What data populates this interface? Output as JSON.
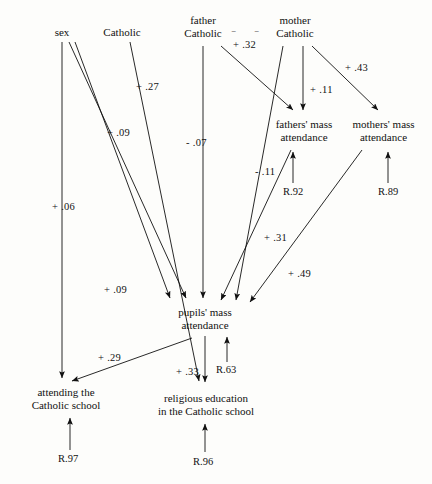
{
  "diagram": {
    "nodes": [
      {
        "id": "sex",
        "label": "sex",
        "x": 62,
        "y": 33,
        "lines": [
          "sex"
        ]
      },
      {
        "id": "catholic",
        "label": "Catholic",
        "x": 122,
        "y": 33,
        "lines": [
          "Catholic"
        ]
      },
      {
        "id": "father_catholic",
        "label": "father Catholic",
        "x": 203,
        "y": 27,
        "lines": [
          "father",
          "Catholic"
        ]
      },
      {
        "id": "mother_catholic",
        "label": "mother Catholic",
        "x": 295,
        "y": 27,
        "lines": [
          "mother",
          "Catholic"
        ]
      },
      {
        "id": "fathers_mass",
        "label": "fathers' mass attendance",
        "x": 303,
        "y": 130,
        "lines": [
          "fathers' mass",
          "attendance"
        ]
      },
      {
        "id": "mothers_mass",
        "label": "mothers' mass attendance",
        "x": 382,
        "y": 130,
        "lines": [
          "mothers' mass",
          "attendance"
        ]
      },
      {
        "id": "pupils_mass",
        "label": "pupils' mass attendance",
        "x": 205,
        "y": 317,
        "lines": [
          "pupils' mass",
          "attendance"
        ]
      },
      {
        "id": "attending",
        "label": "attending the Catholic school",
        "x": 62,
        "y": 395,
        "lines": [
          "attending the",
          "Catholic school"
        ]
      },
      {
        "id": "religious_ed",
        "label": "religious education in the Catholic school",
        "x": 208,
        "y": 400,
        "lines": [
          "religious education",
          "in the Catholic school"
        ]
      }
    ],
    "coefficients": [
      {
        "id": "c_mother_fathersmass",
        "value": "+ .32",
        "x": 233,
        "y": 39
      },
      {
        "id": "c_catholic_pupils",
        "value": "+ .27",
        "x": 136,
        "y": 81
      },
      {
        "id": "c_mother_fmass2",
        "value": "+ .11",
        "x": 310,
        "y": 84
      },
      {
        "id": "c_mother_mmass",
        "value": "+ .43",
        "x": 345,
        "y": 62
      },
      {
        "id": "c_sex_pupils1",
        "value": "+ .09",
        "x": 107,
        "y": 127
      },
      {
        "id": "c_father_pupils",
        "value": "- .07",
        "x": 186,
        "y": 137
      },
      {
        "id": "c_fathercat_pupils",
        "value": "- .11",
        "x": 255,
        "y": 166
      },
      {
        "id": "c_sex_attending",
        "value": "+ .06",
        "x": 52,
        "y": 201
      },
      {
        "id": "c_fmass_pupils",
        "value": "+ .31",
        "x": 264,
        "y": 232
      },
      {
        "id": "c_sex_pupils2",
        "value": "+ .09",
        "x": 104,
        "y": 284
      },
      {
        "id": "c_mmass_pupils",
        "value": "+ .49",
        "x": 288,
        "y": 268
      },
      {
        "id": "c_pupils_attending",
        "value": "+ .29",
        "x": 98,
        "y": 352
      },
      {
        "id": "c_pupils_religed",
        "value": "+ .33",
        "x": 176,
        "y": 366
      }
    ],
    "residuals": [
      {
        "id": "r_fathers_mass",
        "value": "R.92",
        "x": 283,
        "y": 191
      },
      {
        "id": "r_mothers_mass",
        "value": "R.89",
        "x": 378,
        "y": 191
      },
      {
        "id": "r_pupils_mass",
        "value": "R.63",
        "x": 216,
        "y": 369
      },
      {
        "id": "r_attending",
        "value": "R.97",
        "x": 61,
        "y": 458
      },
      {
        "id": "r_religious_ed",
        "value": "R.96",
        "x": 196,
        "y": 461
      }
    ],
    "colors": {
      "ink": "#111111",
      "paper": "#fdfdfb"
    }
  }
}
